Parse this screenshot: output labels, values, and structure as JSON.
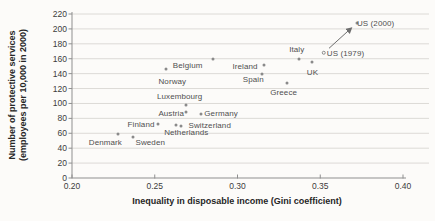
{
  "chart_data": {
    "type": "scatter",
    "title": "",
    "xlabel": "Inequality in disposable income (Gini coefficient)",
    "ylabel_line1": "Number of protective services",
    "ylabel_line2": "(employees per 10,000 in 2000)",
    "xlim": [
      0.2,
      0.4
    ],
    "ylim": [
      0,
      220
    ],
    "grid": "horizontal",
    "legend": "none",
    "x_ticks": [
      {
        "value": 0.2,
        "label": "0.20"
      },
      {
        "value": 0.25,
        "label": "0.25"
      },
      {
        "value": 0.3,
        "label": "0.30"
      },
      {
        "value": 0.35,
        "label": "0.35"
      },
      {
        "value": 0.4,
        "label": "0.40"
      }
    ],
    "y_ticks": [
      {
        "value": 0,
        "label": "0"
      },
      {
        "value": 20,
        "label": "20"
      },
      {
        "value": 40,
        "label": "40"
      },
      {
        "value": 60,
        "label": "60"
      },
      {
        "value": 80,
        "label": "80"
      },
      {
        "value": 100,
        "label": "100"
      },
      {
        "value": 120,
        "label": "120"
      },
      {
        "value": 140,
        "label": "140"
      },
      {
        "value": 160,
        "label": "160"
      },
      {
        "value": 180,
        "label": "180"
      },
      {
        "value": 200,
        "label": "200"
      },
      {
        "value": 220,
        "label": "220"
      }
    ],
    "points": [
      {
        "name": "Denmark",
        "x": 0.228,
        "y": 59,
        "label_dx": -13,
        "label_dy": 7.5
      },
      {
        "name": "Sweden",
        "x": 0.237,
        "y": 55,
        "label_dx": 17,
        "label_dy": 5
      },
      {
        "name": "Finland",
        "x": 0.252,
        "y": 72,
        "label_dx": -17,
        "label_dy": -0.5
      },
      {
        "name": "Norway",
        "x": 0.257,
        "y": 146,
        "label_dx": 6,
        "label_dy": 11.5
      },
      {
        "name": "Netherlands",
        "x": 0.263,
        "y": 71,
        "label_dx": 10,
        "label_dy": 7
      },
      {
        "name": "Switzerland",
        "x": 0.266,
        "y": 70,
        "label_dx": 28.5,
        "label_dy": -1
      },
      {
        "name": "Luxembourg",
        "x": 0.269,
        "y": 98,
        "label_dx": -6.5,
        "label_dy": -9
      },
      {
        "name": "Austria",
        "x": 0.269,
        "y": 88,
        "label_dx": -15,
        "label_dy": 0.5
      },
      {
        "name": "Germany",
        "x": 0.278,
        "y": 86,
        "label_dx": 20,
        "label_dy": -0.5
      },
      {
        "name": "Belgium",
        "x": 0.285,
        "y": 160,
        "label_dx": -25,
        "label_dy": 6
      },
      {
        "name": "Ireland",
        "x": 0.316,
        "y": 152,
        "label_dx": -19,
        "label_dy": 1
      },
      {
        "name": "Spain",
        "x": 0.315,
        "y": 139,
        "label_dx": -9,
        "label_dy": 4.5
      },
      {
        "name": "Greece",
        "x": 0.33,
        "y": 127,
        "label_dx": -3.5,
        "label_dy": 8.5
      },
      {
        "name": "Italy",
        "x": 0.337,
        "y": 160,
        "label_dx": -2,
        "label_dy": -9.5
      },
      {
        "name": "UK",
        "x": 0.345,
        "y": 156,
        "label_dx": 0.5,
        "label_dy": 10
      },
      {
        "name": "US (1979)",
        "x": 0.352,
        "y": 168,
        "open": true,
        "label_dx": 22,
        "label_dy": 0
      },
      {
        "name": "US (2000)",
        "x": 0.372,
        "y": 208,
        "label_dx": 19,
        "label_dy": 0
      }
    ],
    "arrow": {
      "x1": 0.3553,
      "y1": 174,
      "x2": 0.3687,
      "y2": 201
    }
  },
  "colors": {
    "background": "#fcfbf9",
    "dot": "#8a8a8a",
    "grid": "#dcdad6",
    "axis": "#8f8f8f",
    "arrow": "#6e6e6e",
    "country_label": "#4f4f4f",
    "tick_label": "#3c3c3c",
    "axis_title": "#262626"
  }
}
